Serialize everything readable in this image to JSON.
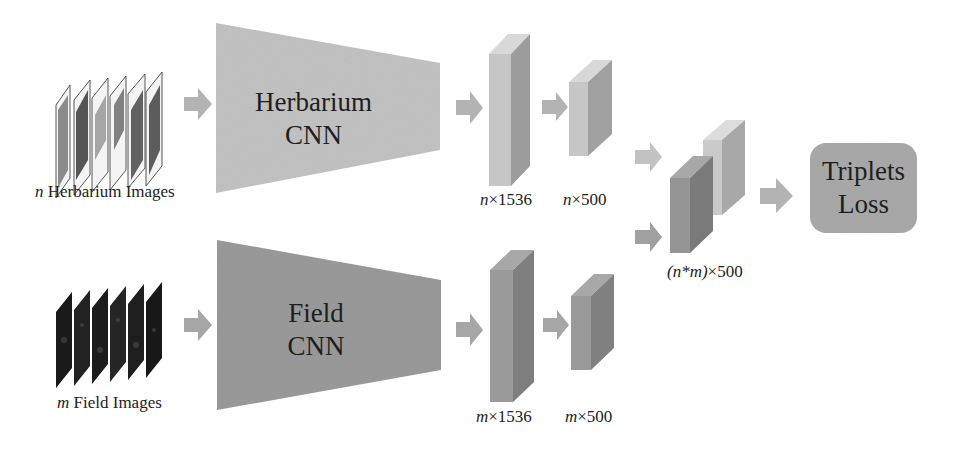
{
  "diagram": {
    "inputs": {
      "herbarium": {
        "var": "n",
        "label": " Herbarium Images"
      },
      "field": {
        "var": "m",
        "label": " Field Images"
      }
    },
    "networks": {
      "herbarium": {
        "line1": "Herbarium",
        "line2": "CNN"
      },
      "field": {
        "line1": "Field",
        "line2": "CNN"
      }
    },
    "features": {
      "herbarium_big": {
        "var": "n",
        "dim": "×1536"
      },
      "herbarium_small": {
        "var": "n",
        "dim": "×500"
      },
      "field_big": {
        "var": "m",
        "dim": "×1536"
      },
      "field_small": {
        "var": "m",
        "dim": "×500"
      },
      "combined": {
        "var": "(n*m)",
        "dim": "×500"
      }
    },
    "loss": {
      "line1": "Triplets",
      "line2": "Loss"
    },
    "colors": {
      "herbarium_fill": "#c2c2c2",
      "field_fill": "#9a9a9a",
      "arrow": "#b3b3b3",
      "loss_fill": "#a9a9a9"
    }
  }
}
